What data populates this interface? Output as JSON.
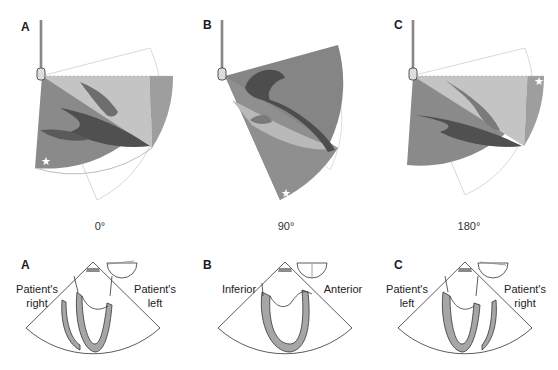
{
  "top_panels": [
    {
      "letter": "A",
      "angle": "0°",
      "star_position": "lower-left"
    },
    {
      "letter": "B",
      "angle": "90°",
      "star_position": "bottom-tip"
    },
    {
      "letter": "C",
      "angle": "180°",
      "star_position": "upper-right"
    }
  ],
  "bottom_panels": [
    {
      "letter": "A",
      "left_label_line1": "Patient's",
      "left_label_line2": "right",
      "right_label_line1": "Patient's",
      "right_label_line2": "left"
    },
    {
      "letter": "B",
      "left_label_line1": "Inferior",
      "left_label_line2": "",
      "right_label_line1": "Anterior",
      "right_label_line2": ""
    },
    {
      "letter": "C",
      "left_label_line1": "Patient's",
      "left_label_line2": "left",
      "right_label_line1": "Patient's",
      "right_label_line2": "right"
    }
  ],
  "colors": {
    "sector_dark": "#7d7d7d",
    "sector_mid": "#9a9a9a",
    "sector_light": "#c9c9c9",
    "heart_dark": "#4a4a4a",
    "heart_fill": "#a8a8a8",
    "outline": "#333333"
  }
}
